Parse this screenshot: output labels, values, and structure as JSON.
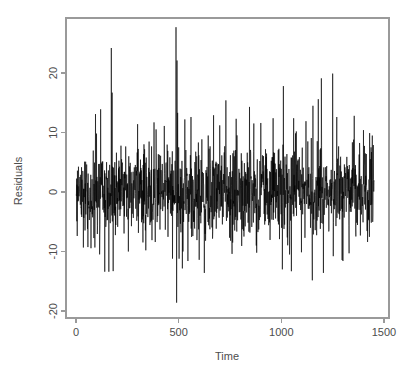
{
  "chart_data": {
    "type": "line",
    "title": "",
    "subtitle": "",
    "xlabel": "Time",
    "ylabel": "Residuals",
    "xlim": [
      -30,
      1490
    ],
    "ylim": [
      -21.5,
      29.0
    ],
    "xticks": [
      0,
      500,
      1000,
      1500
    ],
    "xtick_labels": [
      "0",
      "500",
      "1000",
      "1500"
    ],
    "yticks": [
      -20,
      -10,
      0,
      10,
      20
    ],
    "ytick_labels": [
      "-20",
      "-10",
      "0",
      "10",
      "20"
    ],
    "grid": false,
    "legend": "none",
    "series_name": "residuals",
    "line_color": "#000000",
    "background_color": "#ffffff",
    "axis_color": "#9a9a9a",
    "text_color": "#4d4d4d",
    "n_points": 1452,
    "x_start": 1,
    "x_end": 1452,
    "x_step": 1,
    "noise_sd": 3.6,
    "noise_seed": 20240517,
    "baseline": 0,
    "data_min": -18.6,
    "data_max": 27.7,
    "outliers": [
      {
        "x": 172,
        "y": 24.2
      },
      {
        "x": 176,
        "y": 16.7
      },
      {
        "x": 181,
        "y": -13.3
      },
      {
        "x": 160,
        "y": -13.4
      },
      {
        "x": 487,
        "y": 27.7
      },
      {
        "x": 490,
        "y": -18.6
      },
      {
        "x": 492,
        "y": 22.1
      },
      {
        "x": 495,
        "y": 13.3
      },
      {
        "x": 625,
        "y": -13.6
      },
      {
        "x": 730,
        "y": 15.4
      },
      {
        "x": 845,
        "y": 14.3
      },
      {
        "x": 1010,
        "y": 17.8
      },
      {
        "x": 1005,
        "y": -13.0
      },
      {
        "x": 1195,
        "y": 19.1
      },
      {
        "x": 1205,
        "y": -13.6
      },
      {
        "x": 1250,
        "y": 19.9
      },
      {
        "x": 1300,
        "y": -11.6
      },
      {
        "x": 1355,
        "y": 12.8
      },
      {
        "x": 95,
        "y": 13.1
      },
      {
        "x": 120,
        "y": 13.9
      },
      {
        "x": 140,
        "y": -13.4
      },
      {
        "x": 300,
        "y": 11.4
      },
      {
        "x": 380,
        "y": 11.7
      },
      {
        "x": 430,
        "y": 11.1
      },
      {
        "x": 530,
        "y": 12.2
      },
      {
        "x": 560,
        "y": 12.6
      },
      {
        "x": 600,
        "y": -11.4
      },
      {
        "x": 670,
        "y": 12.9
      },
      {
        "x": 700,
        "y": 11.2
      },
      {
        "x": 780,
        "y": 12.3
      },
      {
        "x": 900,
        "y": 11.6
      },
      {
        "x": 960,
        "y": 12.4
      },
      {
        "x": 1060,
        "y": 12.4
      },
      {
        "x": 1120,
        "y": 11.9
      },
      {
        "x": 1180,
        "y": 15.6
      },
      {
        "x": 1270,
        "y": 12.6
      },
      {
        "x": 1400,
        "y": 10.4
      },
      {
        "x": 1430,
        "y": 9.9
      },
      {
        "x": 255,
        "y": -10.0
      },
      {
        "x": 340,
        "y": -9.8
      },
      {
        "x": 470,
        "y": -11.2
      },
      {
        "x": 545,
        "y": -11.6
      },
      {
        "x": 760,
        "y": -10.4
      },
      {
        "x": 880,
        "y": -10.2
      },
      {
        "x": 1040,
        "y": -10.5
      },
      {
        "x": 1150,
        "y": -9.6
      },
      {
        "x": 1330,
        "y": -10.3
      },
      {
        "x": 1420,
        "y": -8.4
      }
    ]
  },
  "geometry": {
    "plot_left": 66,
    "plot_right": 389,
    "plot_top": 18,
    "plot_bottom": 318,
    "x_pixel_at_0": 76,
    "x_pixel_at_1500": 384,
    "y_pixel_at_20": 73,
    "y_pixel_at_minus20": 311,
    "ylabel_x": 22,
    "ylabel_y": 181,
    "xlabel_x": 227,
    "xlabel_y": 360
  }
}
